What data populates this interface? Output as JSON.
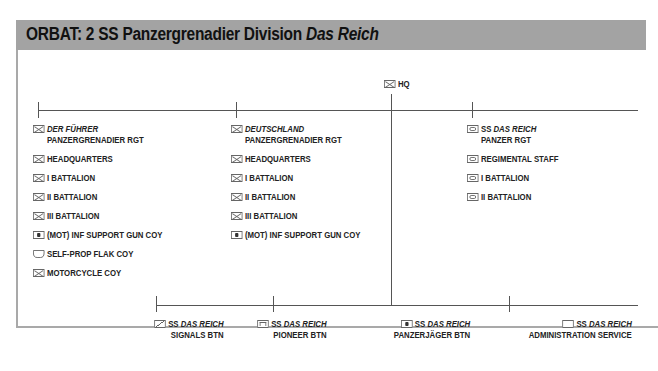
{
  "title": {
    "main": "ORBAT: 2 SS Panzergrenadier Division ",
    "italic": "Das Reich"
  },
  "hq": {
    "icon": "infantry-hq-icon",
    "label": "HQ"
  },
  "top_units": [
    {
      "name_italic": "DER FÜHRER",
      "name_prefix": "",
      "line2": "PANZERGRENADIER RGT",
      "icon": "inf",
      "subunits": [
        {
          "icon": "inf",
          "label": "HEADQUARTERS"
        },
        {
          "icon": "inf",
          "label": "I BATTALION"
        },
        {
          "icon": "inf",
          "label": "II BATTALION"
        },
        {
          "icon": "inf",
          "label": "III BATTALION"
        },
        {
          "icon": "gun",
          "label": "(MOT) INF SUPPORT GUN COY"
        },
        {
          "icon": "flak",
          "label": "SELF-PROP FLAK COY"
        },
        {
          "icon": "inf",
          "label": "MOTORCYCLE COY"
        }
      ]
    },
    {
      "name_italic": "DEUTSCHLAND",
      "name_prefix": "",
      "line2": "PANZERGRENADIER RGT",
      "icon": "inf",
      "subunits": [
        {
          "icon": "inf",
          "label": "HEADQUARTERS"
        },
        {
          "icon": "inf",
          "label": "I BATTALION"
        },
        {
          "icon": "inf",
          "label": "II BATTALION"
        },
        {
          "icon": "inf",
          "label": "III BATTALION"
        },
        {
          "icon": "gun",
          "label": "(MOT) INF SUPPORT GUN COY"
        }
      ]
    },
    {
      "name_italic": "DAS REICH",
      "name_prefix": "SS ",
      "line2": "PANZER RGT",
      "icon": "tank",
      "subunits": [
        {
          "icon": "tank",
          "label": "REGIMENTAL STAFF"
        },
        {
          "icon": "tank",
          "label": "I BATTALION"
        },
        {
          "icon": "tank",
          "label": "II BATTALION"
        }
      ]
    }
  ],
  "bottom_units": [
    {
      "icon": "sig",
      "prefix": "SS ",
      "italic": "DAS REICH",
      "line2": "SIGNALS BTN"
    },
    {
      "icon": "eng",
      "prefix": "SS ",
      "italic": "DAS REICH",
      "line2": "PIONEER BTN"
    },
    {
      "icon": "gun",
      "prefix": "SS ",
      "italic": "DAS REICH",
      "line2": "PANZERJÄGER BTN"
    },
    {
      "icon": "plain",
      "prefix": "SS ",
      "italic": "DAS REICH",
      "line2": "ADMINISTRATION SERVICE"
    }
  ],
  "colors": {
    "title_bar": "#a3a3a3",
    "frame": "#a9a9a9",
    "lines": "#555555",
    "text": "#222222"
  }
}
